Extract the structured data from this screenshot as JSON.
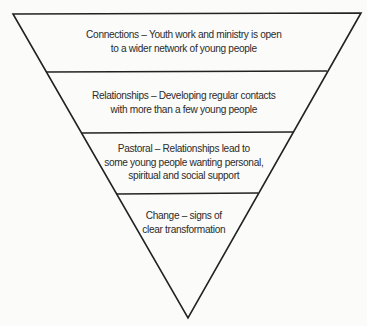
{
  "diagram": {
    "type": "inverted-pyramid",
    "colors": {
      "background": "#fbfbfa",
      "stroke": "#222222",
      "text": "#2b2b2b"
    },
    "tiers": [
      {
        "id": "connections",
        "lines": [
          "Connections – Youth work and ministry is open",
          "to a wider network of young people"
        ]
      },
      {
        "id": "relationships",
        "lines": [
          "Relationships – Developing regular contacts",
          "with more than a few young people"
        ]
      },
      {
        "id": "pastoral",
        "lines": [
          "Pastoral – Relationships lead to",
          "some young people wanting personal,",
          "spiritual and social support"
        ]
      },
      {
        "id": "change",
        "lines": [
          "Change – signs of",
          "clear transformation"
        ]
      }
    ]
  }
}
